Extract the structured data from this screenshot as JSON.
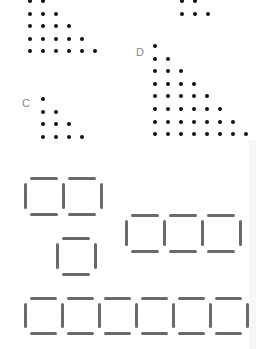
{
  "figures": {
    "dot_triangles": [
      {
        "label": "",
        "origin": [
          28,
          -1
        ],
        "spacing": 13,
        "rows": [
          2,
          3,
          4,
          5,
          6
        ],
        "name": "top-left-triangle"
      },
      {
        "label": "",
        "origin": [
          180,
          -1
        ],
        "spacing": 13,
        "rows": [
          2,
          3
        ],
        "name": "top-right-triangle"
      },
      {
        "label": "C",
        "label_pos": [
          22,
          98
        ],
        "origin": [
          41,
          97
        ],
        "spacing": 13,
        "rows": [
          1,
          2,
          3,
          4
        ],
        "name": "triangle-c"
      },
      {
        "label": "D",
        "label_pos": [
          136,
          47
        ],
        "origin": [
          153,
          44
        ],
        "spacing": 13,
        "rows": [
          1,
          2,
          3,
          4,
          5,
          6,
          7,
          8
        ],
        "name": "triangle-d"
      }
    ],
    "stick_squares": [
      {
        "name": "two-squares",
        "x": 25,
        "y": 177,
        "count": 2,
        "size": 38
      },
      {
        "name": "one-square",
        "x": 57,
        "y": 237,
        "count": 1,
        "size": 38
      },
      {
        "name": "three-squares",
        "x": 126,
        "y": 214,
        "count": 3,
        "size": 38
      },
      {
        "name": "six-squares",
        "x": 25,
        "y": 297,
        "count": 6,
        "size": 37
      }
    ]
  },
  "colors": {
    "dot": "#111111",
    "stick": "#6a6a6a",
    "label": "#888888"
  }
}
